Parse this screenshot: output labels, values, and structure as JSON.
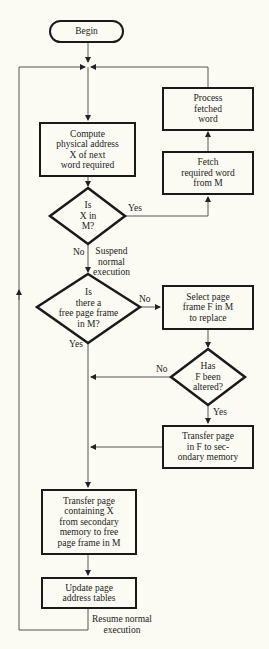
{
  "flowchart": {
    "start": {
      "label": "Begin"
    },
    "steps": {
      "compute": {
        "label": "Compute\nphysical address\nX of next\nword required"
      },
      "fetch": {
        "label": "Fetch\nrequired word\nfrom M"
      },
      "process": {
        "label": "Process\nfetched\nword"
      },
      "select": {
        "label": "Select page\nframe F in M\nto replace"
      },
      "transfer_out": {
        "label": "Transfer page\nin F to sec-\nondary memory"
      },
      "transfer_in": {
        "label": "Transfer page\ncontaining X\nfrom secondary\nmemory to free\npage frame in M"
      },
      "update": {
        "label": "Update page\naddress tables"
      }
    },
    "decisions": {
      "in_memory": {
        "label": "Is\nX in\nM?",
        "yes": "Yes",
        "no": "No"
      },
      "free_frame": {
        "label": "Is\nthere a\nfree page frame\nin M?",
        "yes": "Yes",
        "no": "No"
      },
      "altered": {
        "label": "Has\nF been\naltered?",
        "yes": "Yes",
        "no": "No"
      }
    },
    "annotations": {
      "suspend": "Suspend\nnormal\nexecution",
      "resume": "Resume normal\nexecution"
    },
    "colors": {
      "background": "#fbfbf3",
      "stroke": "#1a1a1a",
      "line": "#555555"
    }
  }
}
